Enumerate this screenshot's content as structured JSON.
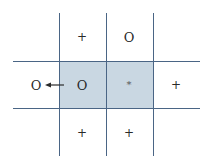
{
  "diagram": {
    "colors": {
      "grid_line": "#4a6585",
      "shaded_cell": "#c9d7e2",
      "symbol": "#2a2a2a"
    },
    "cells": {
      "top_left": "+",
      "top_mid": "O",
      "mid_far_left": "O",
      "mid_left_shaded": "O",
      "mid_center_shaded": "*",
      "mid_right": "+",
      "bottom_left": "+",
      "bottom_mid": "+"
    },
    "arrow": {
      "direction": "left",
      "from": "mid_left_shaded",
      "to": "mid_far_left"
    }
  }
}
